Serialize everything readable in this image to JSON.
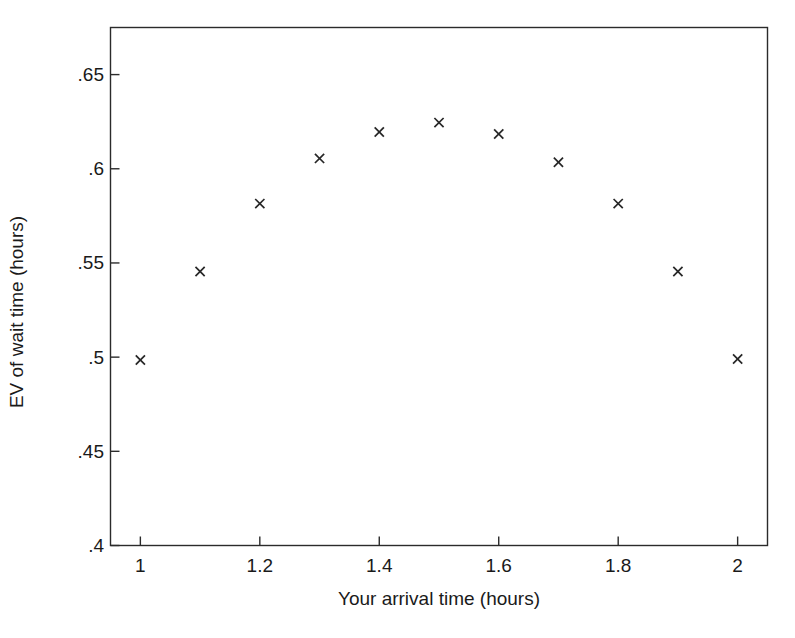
{
  "chart_data": {
    "type": "scatter",
    "title": "",
    "xlabel": "Your arrival time (hours)",
    "ylabel": "EV of wait time (hours)",
    "xlim": [
      0.95,
      2.05
    ],
    "ylim": [
      0.4,
      0.675
    ],
    "grid": false,
    "legend": null,
    "marker": "x",
    "marker_color": "#262626",
    "x": [
      1,
      1.1,
      1.2,
      1.3,
      1.4,
      1.5,
      1.6,
      1.7,
      1.8,
      1.9,
      2
    ],
    "values": [
      0.4985,
      0.5455,
      0.5815,
      0.6055,
      0.6195,
      0.6245,
      0.6185,
      0.6035,
      0.5815,
      0.5455,
      0.499
    ],
    "series": [
      {
        "name": "EV of wait time",
        "values": [
          0.4985,
          0.5455,
          0.5815,
          0.6055,
          0.6195,
          0.6245,
          0.6185,
          0.6035,
          0.5815,
          0.5455,
          0.499
        ]
      }
    ],
    "xticks": [
      1,
      1.2,
      1.4,
      1.6,
      1.8,
      2
    ],
    "xtick_labels": [
      "1",
      "1.2",
      "1.4",
      "1.6",
      "1.8",
      "2"
    ],
    "yticks": [
      0.4,
      0.45,
      0.5,
      0.55,
      0.6,
      0.65
    ],
    "ytick_labels": [
      ".4",
      ".45",
      ".5",
      ".55",
      ".6",
      ".65"
    ]
  },
  "axes": {
    "x_axis_label": "Your arrival time (hours)",
    "y_axis_label": "EV of wait time (hours)"
  },
  "colors": {
    "background": "#ffffff",
    "axis": "#2b2b2b",
    "marker": "#262626",
    "text": "#1a1a1a"
  }
}
